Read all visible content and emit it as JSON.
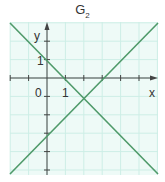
{
  "title": {
    "main": "G",
    "sub": "2"
  },
  "axes": {
    "x_label": "x",
    "y_label": "y",
    "origin_label": "0",
    "x_tick_label": "1",
    "y_tick_label": "1"
  },
  "colors": {
    "grid_bg": "#eefaf7",
    "grid_line": "#cdeee6",
    "axis": "#444444",
    "line": "#4f9a6a"
  },
  "chart_data": {
    "type": "line",
    "title": "G2",
    "xlabel": "x",
    "ylabel": "y",
    "xlim": [
      -2,
      6
    ],
    "ylim": [
      -5.3,
      3
    ],
    "grid": true,
    "series": [
      {
        "name": "y = -x + 1",
        "points": [
          [
            -2,
            3
          ],
          [
            6,
            -5
          ]
        ]
      },
      {
        "name": "y = x - 3",
        "points": [
          [
            -2,
            -5
          ],
          [
            6,
            3
          ]
        ]
      }
    ],
    "annotations": [
      "0",
      "1 (x-axis)",
      "1 (y-axis)"
    ]
  }
}
